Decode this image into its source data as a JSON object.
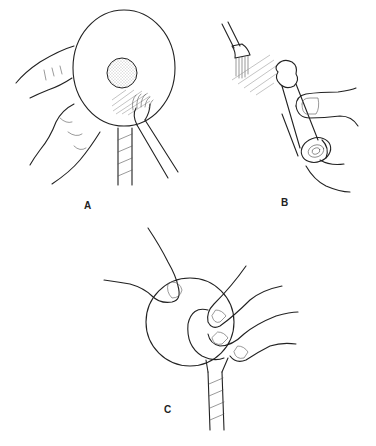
{
  "figure": {
    "panels": [
      {
        "id": "A",
        "label": "A",
        "description": "Hands holding round disc with central stippled circle; brush applying adhesive near spiral-wrapped cord"
      },
      {
        "id": "B",
        "label": "B",
        "description": "Brush applying to shaded area; fingers holding rolled cylindrical object"
      },
      {
        "id": "C",
        "label": "C",
        "description": "Fingers pressing smaller disc onto larger disc above spiral-wrapped cord"
      }
    ],
    "caption": ""
  }
}
